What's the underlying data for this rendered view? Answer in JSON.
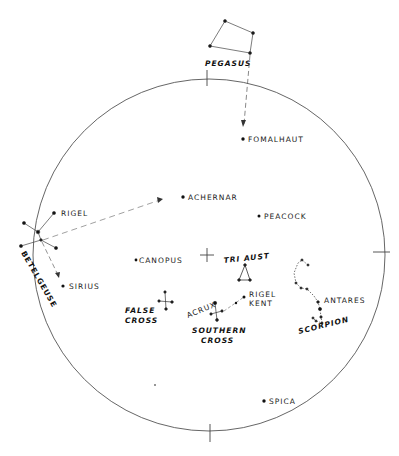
{
  "circle": {
    "cx": 209,
    "cy": 255,
    "r": 176,
    "stroke": "#555555"
  },
  "stars": {
    "fomalhaut": {
      "label": "FOMALHAUT",
      "x": 243,
      "y": 139
    },
    "achernar": {
      "label": "ACHERNAR",
      "x": 183,
      "y": 197
    },
    "peacock": {
      "label": "PEACOCK",
      "x": 259,
      "y": 216
    },
    "canopus": {
      "label": "CANOPUS",
      "x": 136,
      "y": 260
    },
    "sirius": {
      "label": "SIRIUS",
      "x": 63,
      "y": 286
    },
    "rigel": {
      "label": "RIGEL",
      "x": 54,
      "y": 213
    },
    "betelgeuse": {
      "label": "BETELGEUSE"
    },
    "acrux": {
      "label": "ACRUX"
    },
    "rigel_kent": {
      "label_line1": "RIGEL",
      "label_line2": "KENT"
    },
    "antares": {
      "label": "ANTARES"
    },
    "spica": {
      "label": "SPICA",
      "x": 264,
      "y": 401
    }
  },
  "constellations": {
    "pegasus": {
      "label": "PEGASUS"
    },
    "tri_aust": {
      "label": "TRI AUST"
    },
    "false_cross": {
      "label_line1": "FALSE",
      "label_line2": "CROSS"
    },
    "southern_cross": {
      "label_line1": "SOUTHERN",
      "label_line2": "CROSS"
    },
    "scorpion": {
      "label": "SCORPION"
    }
  }
}
